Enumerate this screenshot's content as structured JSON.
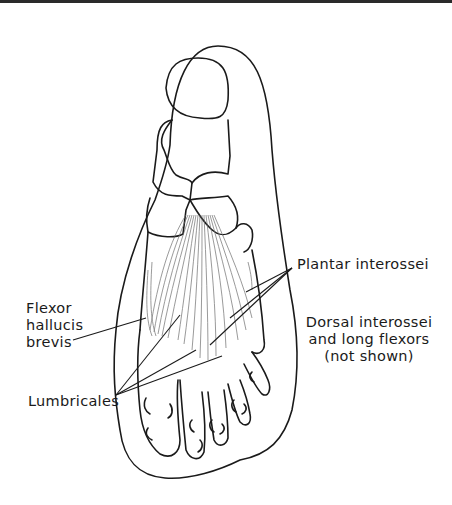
{
  "figure": {
    "labels": {
      "flexor_hallucis_brevis": [
        "Flexor",
        "hallucis",
        "brevis"
      ],
      "lumbricales": "Lumbricales",
      "plantar_interossei": "Plantar interossei",
      "dorsal_interossei": [
        "Dorsal interossei",
        "and long flexors",
        "(not shown)"
      ]
    },
    "colors": {
      "line": "#1a1a1a",
      "muscle": "#6b6b6b",
      "background": "#ffffff"
    }
  }
}
